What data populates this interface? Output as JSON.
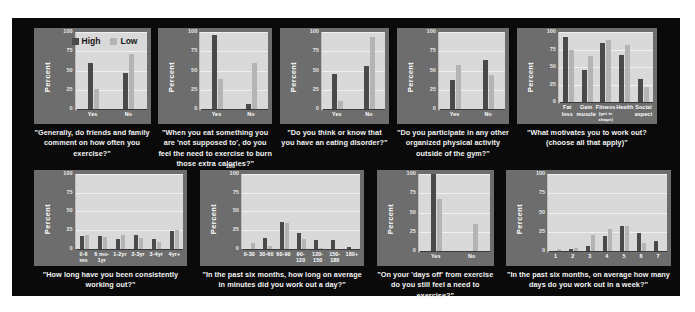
{
  "figure": {
    "background": "#0a0a0a",
    "panel_background": "#6d6d6d",
    "plot_background": "#d9d9d9",
    "high_color": "#4a4a4a",
    "low_color": "#b4b4b4",
    "ylabel": "Percent",
    "yticks": [
      "100",
      "75",
      "50",
      "25",
      "0"
    ],
    "stray_label": "100",
    "legend": [
      {
        "label": "High",
        "color": "#4a4a4a"
      },
      {
        "label": "Low",
        "color": "#b4b4b4"
      }
    ]
  },
  "chart_data": [
    {
      "id": "chart-friends-family-comment",
      "type": "bar",
      "title": "",
      "caption": "\"Generally, do friends and family comment on how often you exercise?\"",
      "xlabel": "",
      "ylabel": "Percent",
      "ylim": [
        0,
        100
      ],
      "yticks": [
        0,
        25,
        50,
        75,
        100
      ],
      "grid": true,
      "legend": [
        "High",
        "Low"
      ],
      "legend_position": "inside-top-center",
      "categories": [
        "Yes",
        "No"
      ],
      "series": [
        {
          "name": "High",
          "values": [
            60,
            47
          ]
        },
        {
          "name": "Low",
          "values": [
            26,
            71
          ]
        }
      ]
    },
    {
      "id": "chart-not-supposed-to-eat",
      "type": "bar",
      "title": "",
      "caption": "\"When you eat something you are 'not supposed to', do you feel the need to exercise to burn those extra calories?\"",
      "xlabel": "",
      "ylabel": "Percent",
      "ylim": [
        0,
        100
      ],
      "yticks": [
        0,
        25,
        50,
        75,
        100
      ],
      "grid": true,
      "legend": [
        "High",
        "Low"
      ],
      "categories": [
        "Yes",
        "No"
      ],
      "series": [
        {
          "name": "High",
          "values": [
            96,
            7
          ]
        },
        {
          "name": "Low",
          "values": [
            39,
            60
          ]
        }
      ]
    },
    {
      "id": "chart-eating-disorder",
      "type": "bar",
      "title": "",
      "caption": "\"Do you think or know that you have an eating disorder?\"",
      "xlabel": "",
      "ylabel": "Percent",
      "ylim": [
        0,
        100
      ],
      "yticks": [
        0,
        25,
        50,
        75,
        100
      ],
      "grid": true,
      "legend": [
        "High",
        "Low"
      ],
      "categories": [
        "Yes",
        "No"
      ],
      "series": [
        {
          "name": "High",
          "values": [
            46,
            56
          ]
        },
        {
          "name": "Low",
          "values": [
            11,
            94
          ]
        }
      ]
    },
    {
      "id": "chart-other-physical-activity",
      "type": "bar",
      "title": "",
      "caption": "\"Do you participate in any other organized physical activity outside of the gym?\"",
      "xlabel": "",
      "ylabel": "Percent",
      "ylim": [
        0,
        100
      ],
      "yticks": [
        0,
        25,
        50,
        75,
        100
      ],
      "grid": true,
      "legend": [
        "High",
        "Low"
      ],
      "categories": [
        "Yes",
        "No"
      ],
      "series": [
        {
          "name": "High",
          "values": [
            38,
            64
          ]
        },
        {
          "name": "Low",
          "values": [
            57,
            44
          ]
        }
      ]
    },
    {
      "id": "chart-motivation",
      "type": "bar",
      "title": "",
      "caption": "\"What motivates you to work out? (choose all that apply)\"",
      "xlabel": "",
      "ylabel": "Percent",
      "ylim": [
        0,
        100
      ],
      "yticks": [
        0,
        25,
        50,
        75,
        100
      ],
      "grid": true,
      "legend": [
        "High",
        "Low"
      ],
      "categories": [
        "Fat loss",
        "Gain muscle",
        "Fitness (get in shape)",
        "Health",
        "Social aspect"
      ],
      "category_lines": [
        [
          "Fat",
          "loss"
        ],
        [
          "Gain",
          "muscle"
        ],
        [
          "Fitness",
          "(get in shape)"
        ],
        [
          "Health",
          ""
        ],
        [
          "Social",
          "aspect"
        ]
      ],
      "series": [
        {
          "name": "High",
          "values": [
            93,
            46,
            84,
            67,
            33
          ]
        },
        {
          "name": "Low",
          "values": [
            74,
            66,
            88,
            81,
            22
          ]
        }
      ]
    },
    {
      "id": "chart-how-long-working-out",
      "type": "bar",
      "title": "",
      "caption": "\"How long have you been consistently working out?\"",
      "xlabel": "",
      "ylabel": "Percent",
      "ylim": [
        0,
        100
      ],
      "yticks": [
        0,
        25,
        50,
        75,
        100
      ],
      "grid": true,
      "legend": [
        "High",
        "Low"
      ],
      "categories": [
        "0-6 mo",
        "6 mo-1yr",
        "1-2yr",
        "2-3yr",
        "3-4yr",
        "4yr+"
      ],
      "category_lines": [
        [
          "0-6",
          "mo"
        ],
        [
          "6 mo-",
          "1yr"
        ],
        [
          "1-2yr",
          ""
        ],
        [
          "2-3yr",
          ""
        ],
        [
          "3-4yr",
          ""
        ],
        [
          "4yr+",
          ""
        ]
      ],
      "series": [
        {
          "name": "High",
          "values": [
            17,
            17,
            13,
            18,
            13,
            24
          ]
        },
        {
          "name": "Low",
          "values": [
            18,
            16,
            18,
            14,
            9,
            25
          ]
        }
      ]
    },
    {
      "id": "chart-minutes-per-day",
      "type": "bar",
      "title": "",
      "caption": "\"In the past six months, how long on average in minutes did you work out a day?\"",
      "xlabel": "",
      "ylabel": "Percent",
      "ylim": [
        0,
        100
      ],
      "yticks": [
        0,
        25,
        50,
        75,
        100
      ],
      "grid": true,
      "legend": [
        "High",
        "Low"
      ],
      "categories": [
        "0-30",
        "30-60",
        "60-90",
        "90-120",
        "120-150",
        "150-180",
        "180+"
      ],
      "category_lines": [
        [
          "0-30",
          ""
        ],
        [
          "30-60",
          ""
        ],
        [
          "60-90",
          ""
        ],
        [
          "90-120",
          ""
        ],
        [
          "120-",
          "150"
        ],
        [
          "150-",
          "180"
        ],
        [
          "180+",
          ""
        ]
      ],
      "series": [
        {
          "name": "High",
          "values": [
            0,
            14,
            35,
            21,
            11,
            11,
            2
          ]
        },
        {
          "name": "Low",
          "values": [
            7,
            3,
            34,
            13,
            1,
            0,
            0
          ]
        }
      ]
    },
    {
      "id": "chart-days-off",
      "type": "bar",
      "title": "",
      "caption": "\"On your 'days off' from exercise do you still feel a need to exercise?\"",
      "xlabel": "",
      "ylabel": "Percent",
      "ylim": [
        0,
        100
      ],
      "yticks": [
        0,
        25,
        50,
        75,
        100
      ],
      "grid": true,
      "legend": [
        "High",
        "Low"
      ],
      "categories": [
        "Yes",
        "No"
      ],
      "series": [
        {
          "name": "High",
          "values": [
            100,
            0
          ]
        },
        {
          "name": "Low",
          "values": [
            67,
            35
          ]
        }
      ]
    },
    {
      "id": "chart-days-per-week",
      "type": "bar",
      "title": "",
      "caption": "\"In the past six months, on average how many days do you work out in a week?\"",
      "xlabel": "",
      "ylabel": "Percent",
      "ylim": [
        0,
        100
      ],
      "yticks": [
        0,
        25,
        50,
        75,
        100
      ],
      "grid": true,
      "legend": [
        "High",
        "Low"
      ],
      "categories": [
        "1",
        "2",
        "3",
        "4",
        "5",
        "6",
        "7"
      ],
      "series": [
        {
          "name": "High",
          "values": [
            0,
            2,
            7,
            20,
            32,
            24,
            13
          ]
        },
        {
          "name": "Low",
          "values": [
            2,
            4,
            21,
            29,
            32,
            11,
            0
          ]
        }
      ]
    }
  ],
  "layout": {
    "panels": [
      {
        "chart": 0,
        "left": 28,
        "top": 10,
        "width": 152,
        "chart_height": 96,
        "legend": true,
        "legend_left": 38,
        "legend_top": 8
      },
      {
        "chart": 1,
        "left": 190,
        "top": 10,
        "width": 148,
        "chart_height": 96,
        "legend": false
      },
      {
        "chart": 2,
        "left": 348,
        "top": 10,
        "width": 142,
        "chart_height": 96,
        "legend": false
      },
      {
        "chart": 3,
        "left": 500,
        "top": 10,
        "width": 146,
        "chart_height": 96,
        "legend": false
      },
      {
        "chart": 4,
        "left": 656,
        "top": 10,
        "width": 182,
        "chart_height": 96,
        "legend": false
      }
    ],
    "panels_bottom": [
      {
        "chart": 5,
        "left": 28,
        "top": 152,
        "width": 200,
        "chart_height": 96
      },
      {
        "chart": 6,
        "left": 244,
        "top": 152,
        "width": 214,
        "chart_height": 96,
        "stray": true
      },
      {
        "chart": 7,
        "left": 474,
        "top": 152,
        "width": 152,
        "chart_height": 96
      },
      {
        "chart": 8,
        "left": 642,
        "top": 152,
        "width": 214,
        "chart_height": 96
      }
    ]
  }
}
